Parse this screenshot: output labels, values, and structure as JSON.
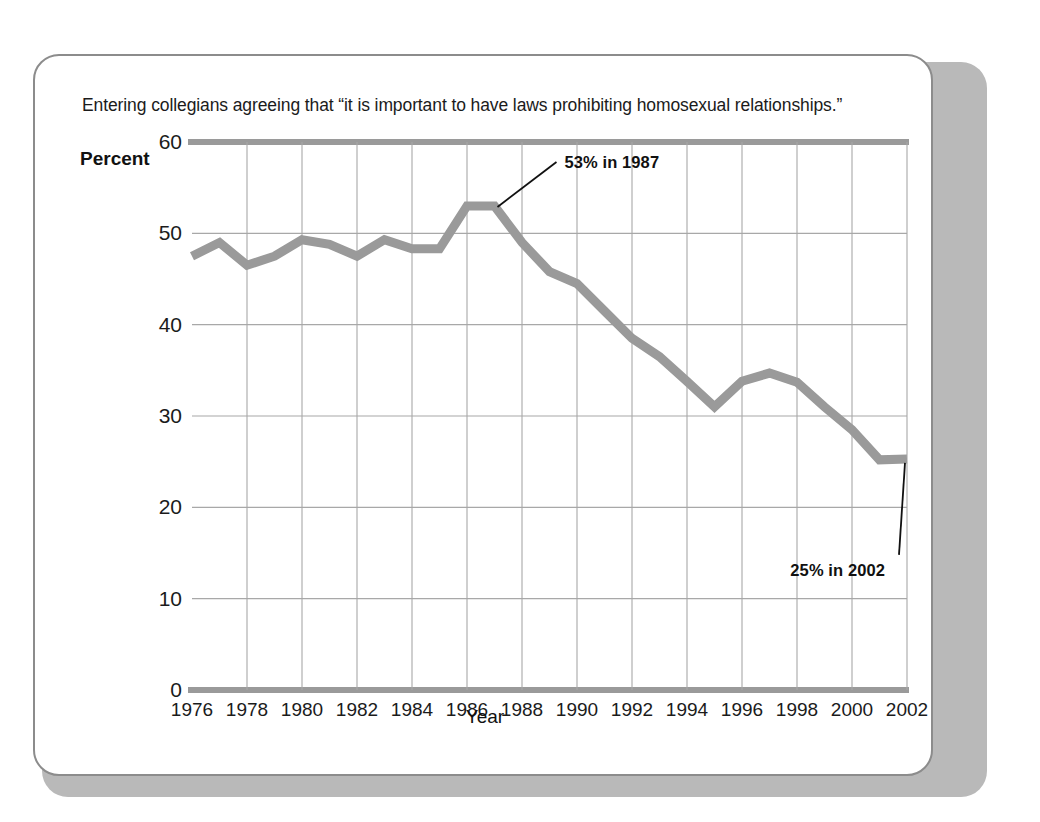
{
  "chart_data": {
    "type": "line",
    "title": "Entering collegians agreeing that “it is important to have laws prohibiting homosexual relationships.”",
    "xlabel": "Year",
    "ylabel": "Percent",
    "ylim": [
      0,
      60
    ],
    "xlim": [
      1976,
      2002
    ],
    "grid": true,
    "legend_position": "none",
    "line_color": "#9a9a9a",
    "gridline_color": "#a8a8a8",
    "axis_color": "#9a9a9a",
    "yticks": [
      60,
      50,
      40,
      30,
      20,
      10,
      0
    ],
    "xticks": [
      1976,
      1978,
      1980,
      1982,
      1984,
      1986,
      1988,
      1990,
      1992,
      1994,
      1996,
      1998,
      2000,
      2002
    ],
    "x": [
      1976,
      1977,
      1978,
      1979,
      1980,
      1981,
      1982,
      1983,
      1984,
      1985,
      1986,
      1987,
      1988,
      1989,
      1990,
      1991,
      1992,
      1993,
      1994,
      1995,
      1996,
      1997,
      1998,
      1999,
      2000,
      2001,
      2002
    ],
    "values": [
      47.5,
      49.0,
      46.5,
      47.5,
      49.3,
      48.8,
      47.5,
      49.3,
      48.3,
      48.3,
      53.0,
      53.0,
      49.0,
      45.8,
      44.5,
      41.5,
      38.5,
      36.5,
      33.8,
      31.0,
      33.8,
      34.7,
      33.7,
      31.0,
      28.5,
      25.2,
      25.3
    ],
    "series_name": "Percent agreeing",
    "annotations": [
      {
        "text": "53% in 1987",
        "year": 1987,
        "value": 53.0
      },
      {
        "text": "25% in 2002",
        "year": 2002,
        "value": 25.3
      }
    ]
  }
}
